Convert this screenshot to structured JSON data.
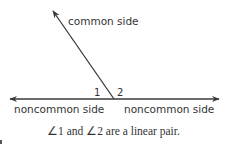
{
  "diagram": {
    "colors": {
      "line": "#3a3a3a",
      "text": "#333333",
      "background": "#ffffff"
    },
    "labels": {
      "common_side": "common side",
      "noncommon_side_left": "noncommon side",
      "noncommon_side_right": "noncommon side",
      "angle_1": "1",
      "angle_2": "2"
    },
    "caption": "∠1 and ∠2 are a linear pair.",
    "geometry": {
      "vertex": [
        114,
        99
      ],
      "common_side_end": [
        52,
        10
      ],
      "line_left_end": [
        8,
        99
      ],
      "line_right_end": [
        221,
        99
      ]
    }
  }
}
